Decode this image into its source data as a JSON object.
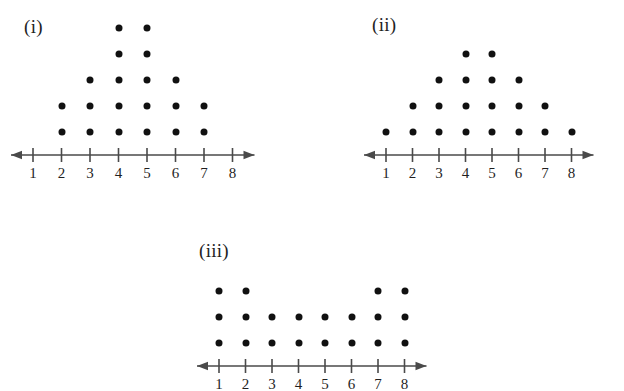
{
  "figure": {
    "background_color": "#ffffff",
    "dot_color": "#111111",
    "axis_color": "#4a4a4a",
    "text_color": "#1f1f1f"
  },
  "plots": [
    {
      "label": "(i)",
      "label_x": 24,
      "label_y": 16,
      "origin_x": 33,
      "axis_y": 155,
      "tick_spacing": 28.5,
      "row_spacing": 26,
      "first_row_offset": 23,
      "axis_left_pad": 22,
      "axis_right_pad": 22,
      "chart_data": {
        "type": "dotplot",
        "title": "(i)",
        "xlabel": "",
        "ylabel": "",
        "categories": [
          1,
          2,
          3,
          4,
          5,
          6,
          7,
          8
        ],
        "values": [
          0,
          2,
          3,
          5,
          5,
          3,
          2,
          0
        ],
        "total_dots": 20,
        "xlim": [
          1,
          8
        ],
        "grid": false,
        "legend": "none"
      }
    },
    {
      "label": "(ii)",
      "label_x": 372,
      "label_y": 14,
      "origin_x": 386,
      "axis_y": 155,
      "tick_spacing": 26.5,
      "row_spacing": 26,
      "first_row_offset": 23,
      "axis_left_pad": 22,
      "axis_right_pad": 22,
      "chart_data": {
        "type": "dotplot",
        "title": "(ii)",
        "xlabel": "",
        "ylabel": "",
        "categories": [
          1,
          2,
          3,
          4,
          5,
          6,
          7,
          8
        ],
        "values": [
          1,
          2,
          3,
          4,
          4,
          3,
          2,
          1
        ],
        "total_dots": 20,
        "xlim": [
          1,
          8
        ],
        "grid": false,
        "legend": "none"
      }
    },
    {
      "label": "(iii)",
      "label_x": 199,
      "label_y": 240,
      "origin_x": 219,
      "axis_y": 366,
      "tick_spacing": 26.5,
      "row_spacing": 26,
      "first_row_offset": 23,
      "axis_left_pad": 22,
      "axis_right_pad": 22,
      "chart_data": {
        "type": "dotplot",
        "title": "(iii)",
        "xlabel": "",
        "ylabel": "",
        "categories": [
          1,
          2,
          3,
          4,
          5,
          6,
          7,
          8
        ],
        "values": [
          3,
          3,
          2,
          2,
          2,
          2,
          3,
          3
        ],
        "total_dots": 20,
        "xlim": [
          1,
          8
        ],
        "grid": false,
        "legend": "none"
      }
    }
  ],
  "chart_data": [
    {
      "type": "dotplot",
      "title": "(i)",
      "categories": [
        1,
        2,
        3,
        4,
        5,
        6,
        7,
        8
      ],
      "values": [
        0,
        2,
        3,
        5,
        5,
        3,
        2,
        0
      ],
      "xlabel": "",
      "ylabel": "",
      "xlim": [
        1,
        8
      ],
      "grid": false
    },
    {
      "type": "dotplot",
      "title": "(ii)",
      "categories": [
        1,
        2,
        3,
        4,
        5,
        6,
        7,
        8
      ],
      "values": [
        1,
        2,
        3,
        4,
        4,
        3,
        2,
        1
      ],
      "xlabel": "",
      "ylabel": "",
      "xlim": [
        1,
        8
      ],
      "grid": false
    },
    {
      "type": "dotplot",
      "title": "(iii)",
      "categories": [
        1,
        2,
        3,
        4,
        5,
        6,
        7,
        8
      ],
      "values": [
        3,
        3,
        2,
        2,
        2,
        2,
        3,
        3
      ],
      "xlabel": "",
      "ylabel": "",
      "xlim": [
        1,
        8
      ],
      "grid": false
    }
  ]
}
